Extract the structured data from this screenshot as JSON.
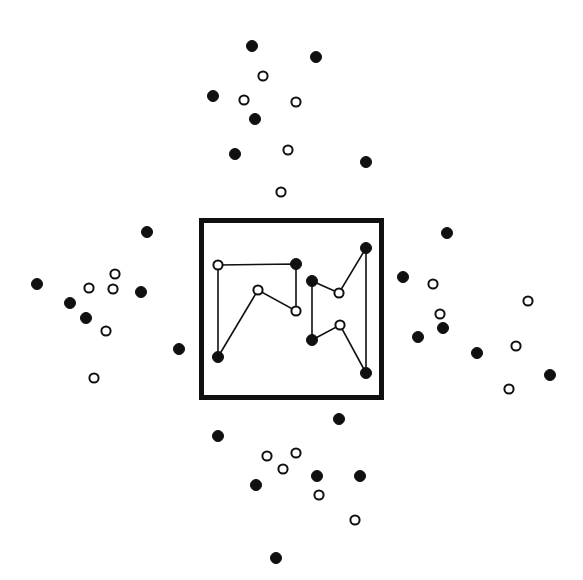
{
  "figure": {
    "title": "",
    "width": 583,
    "height": 580,
    "background_color": "#ffffff",
    "ink_color": "#101010"
  },
  "legend": {
    "filled_label": "filled point",
    "open_label": "open point",
    "box_label": "region of interest boundary",
    "edge_label": "connecting path segment"
  },
  "chart_data": {
    "type": "scatter",
    "title": "",
    "xlabel": "",
    "ylabel": "",
    "xlim": [
      0,
      583
    ],
    "ylim": [
      580,
      0
    ],
    "grid": false,
    "legend_position": "none",
    "marker_radius_filled": 5.5,
    "marker_radius_open": 4.6,
    "boundary_box": {
      "x": 199,
      "y": 218,
      "width": 185,
      "height": 182,
      "stroke_width": 5,
      "color": "#101010"
    },
    "series": [
      {
        "name": "inside-filled",
        "marker": "filled",
        "color": "#101010",
        "points": [
          [
            296,
            264
          ],
          [
            218,
            357
          ],
          [
            312,
            281
          ],
          [
            366,
            248
          ],
          [
            312,
            340
          ],
          [
            366,
            373
          ]
        ]
      },
      {
        "name": "inside-open",
        "marker": "open",
        "color": "#ffffff",
        "points": [
          [
            218,
            265
          ],
          [
            258,
            290
          ],
          [
            296,
            311
          ],
          [
            339,
            293
          ],
          [
            340,
            325
          ]
        ]
      },
      {
        "name": "outside-filled",
        "marker": "filled",
        "color": "#101010",
        "points": [
          [
            252,
            46
          ],
          [
            316,
            57
          ],
          [
            213,
            96
          ],
          [
            255,
            119
          ],
          [
            235,
            154
          ],
          [
            366,
            162
          ],
          [
            147,
            232
          ],
          [
            447,
            233
          ],
          [
            37,
            284
          ],
          [
            403,
            277
          ],
          [
            141,
            292
          ],
          [
            70,
            303
          ],
          [
            86,
            318
          ],
          [
            418,
            337
          ],
          [
            443,
            328
          ],
          [
            179,
            349
          ],
          [
            477,
            353
          ],
          [
            550,
            375
          ],
          [
            339,
            419
          ],
          [
            218,
            436
          ],
          [
            317,
            476
          ],
          [
            360,
            476
          ],
          [
            256,
            485
          ],
          [
            276,
            558
          ]
        ]
      },
      {
        "name": "outside-open",
        "marker": "open",
        "color": "#ffffff",
        "points": [
          [
            263,
            76
          ],
          [
            244,
            100
          ],
          [
            296,
            102
          ],
          [
            288,
            150
          ],
          [
            281,
            192
          ],
          [
            115,
            274
          ],
          [
            89,
            288
          ],
          [
            113,
            289
          ],
          [
            106,
            331
          ],
          [
            94,
            378
          ],
          [
            433,
            284
          ],
          [
            528,
            301
          ],
          [
            440,
            314
          ],
          [
            516,
            346
          ],
          [
            509,
            389
          ],
          [
            267,
            456
          ],
          [
            296,
            453
          ],
          [
            283,
            469
          ],
          [
            319,
            495
          ],
          [
            355,
            520
          ]
        ]
      }
    ],
    "paths": [
      {
        "name": "left-path",
        "vertices": [
          [
            218,
            265
          ],
          [
            296,
            264
          ],
          [
            296,
            311
          ],
          [
            258,
            290
          ],
          [
            218,
            357
          ]
        ]
      },
      {
        "name": "left-path-closing",
        "vertices": [
          [
            218,
            265
          ],
          [
            218,
            357
          ]
        ]
      },
      {
        "name": "right-path",
        "vertices": [
          [
            312,
            281
          ],
          [
            339,
            293
          ],
          [
            366,
            248
          ],
          [
            366,
            373
          ],
          [
            340,
            325
          ],
          [
            312,
            340
          ]
        ]
      },
      {
        "name": "right-path-closing",
        "vertices": [
          [
            312,
            281
          ],
          [
            312,
            340
          ]
        ]
      }
    ]
  }
}
